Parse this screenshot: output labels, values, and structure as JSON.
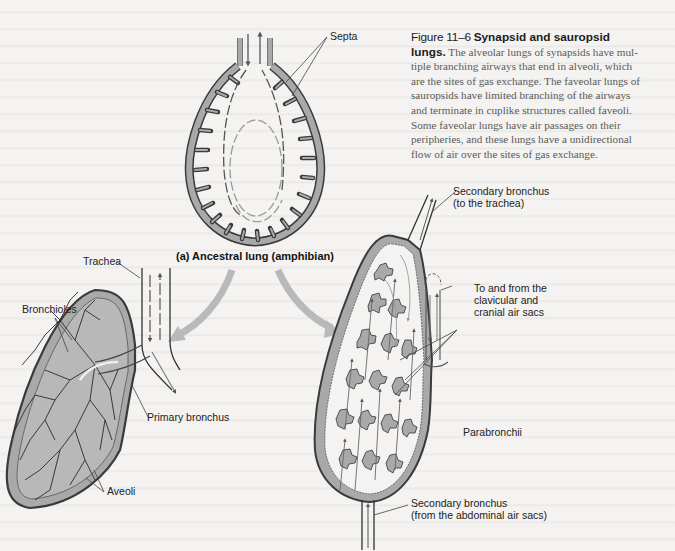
{
  "caption": {
    "figure_number": "Figure 11–6",
    "title": "Synapsid and sauropsid lungs.",
    "title_part1": "Synapsid and sauropsid",
    "title_part2": "lungs.",
    "body": "The alveolar lungs of synapsids have multiple branching airways that end in alveoli, which are the sites of gas exchange. The faveolar lungs of sauropsids have limited branching of the airways and terminate in cuplike structures called faveoli. Some faveolar lungs have air passages on their peripheries, and these lungs have a unidirectional flow of air over the sites of gas exchange.",
    "lines": [
      "The alveolar lungs of synapsids have mul-",
      "tiple branching airways that end in alveoli, which",
      "are the sites of gas exchange. The faveolar lungs of",
      "sauropsids have limited branching of the airways",
      "and terminate in cuplike structures called faveoli.",
      "Some faveolar lungs have air passages on their",
      "peripheries, and these lungs have a unidirectional",
      "flow of air over the sites of gas exchange."
    ]
  },
  "panels": {
    "ancestral": {
      "title": "(a) Ancestral lung (amphibian)",
      "labels": {
        "septa": "Septa"
      }
    },
    "synapsid": {
      "labels": {
        "trachea": "Trachea",
        "bronchioles": "Bronchioles",
        "primary_bronchus": "Primary bronchus",
        "alveoli": "Aveoli"
      }
    },
    "sauropsid": {
      "labels": {
        "secondary_bronchus_top_1": "Secondary bronchus",
        "secondary_bronchus_top_2": "(to the trachea)",
        "air_sacs_1": "To and from the",
        "air_sacs_2": "clavicular and",
        "air_sacs_3": "cranial air sacs",
        "parabronchii": "Parabronchii",
        "secondary_bronchus_bottom_1": "Secondary bronchus",
        "secondary_bronchus_bottom_2": "(from the abdominal air sacs)"
      }
    }
  },
  "colors": {
    "paper": "#f4f3f1",
    "lung_fill": "#a9a9a9",
    "lung_outline": "#3a3a3a",
    "evolution_arrow": "#b9b9b9",
    "airflow_dark": "#555555",
    "airflow_light": "#9a9a9a",
    "caption_text": "#5a5a5a"
  }
}
